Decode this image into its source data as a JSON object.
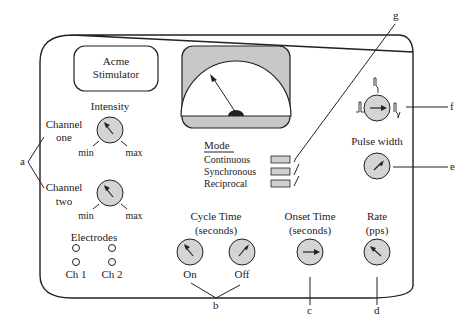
{
  "title_box": {
    "line1": "Acme",
    "line2": "Stimulator"
  },
  "intensity": {
    "title": "Intensity",
    "channel_one": {
      "line1": "Channel",
      "line2": "one",
      "min": "min",
      "max": "max"
    },
    "channel_two": {
      "line1": "Channel",
      "line2": "two",
      "min": "min",
      "max": "max"
    }
  },
  "electrodes": {
    "title": "Electrodes",
    "ch1": "Ch 1",
    "ch2": "Ch 2"
  },
  "mode": {
    "title": "Mode",
    "options": [
      "Continuous",
      "Synchronous",
      "Reciprocal"
    ]
  },
  "cycle_time": {
    "line1": "Cycle Time",
    "line2": "(seconds)",
    "on": "On",
    "off": "Off"
  },
  "onset_time": {
    "line1": "Onset Time",
    "line2": "(seconds)"
  },
  "rate": {
    "line1": "Rate",
    "line2": "(pps)"
  },
  "pulse_width": {
    "title": "Pulse width"
  },
  "callouts": {
    "a": "a",
    "b": "b",
    "c": "c",
    "d": "d",
    "e": "e",
    "f": "f",
    "g": "g"
  },
  "colors": {
    "panel_stroke": "#222222",
    "knob_fill": "#d4d4d4",
    "meter_bezel": "#c8c8c8",
    "mode_switch_fill": "#d0d0d0"
  }
}
